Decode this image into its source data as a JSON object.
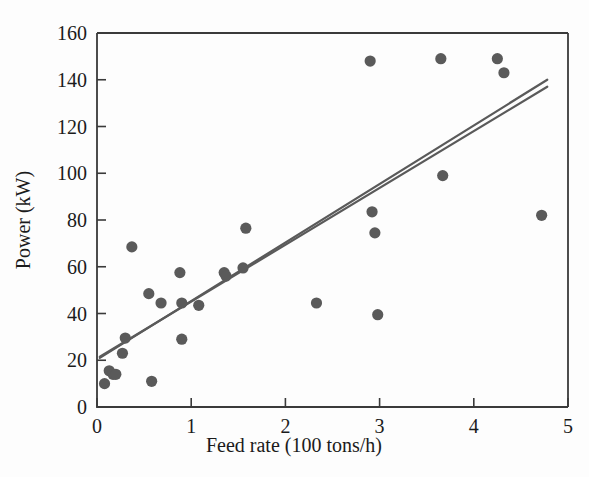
{
  "chart_data": {
    "type": "scatter",
    "title": "",
    "xlabel": "Feed rate (100 tons/h)",
    "ylabel": "Power (kW)",
    "xlim": [
      0,
      5
    ],
    "ylim": [
      0,
      160
    ],
    "xticks": [
      0,
      1,
      2,
      3,
      4,
      5
    ],
    "yticks": [
      0,
      20,
      40,
      60,
      80,
      100,
      120,
      140,
      160
    ],
    "xtick_labels": [
      "0",
      "1",
      "2",
      "3",
      "4",
      "5"
    ],
    "ytick_labels": [
      "0",
      "20",
      "40",
      "60",
      "80",
      "100",
      "120",
      "140",
      "160"
    ],
    "grid": false,
    "legend": "none",
    "marker_color": "#5a5a5a",
    "line_color": "#5a5a5a",
    "points": [
      {
        "x": 0.08,
        "y": 10.0
      },
      {
        "x": 0.13,
        "y": 15.5
      },
      {
        "x": 0.17,
        "y": 14.0
      },
      {
        "x": 0.2,
        "y": 14.0
      },
      {
        "x": 0.27,
        "y": 23.0
      },
      {
        "x": 0.3,
        "y": 29.5
      },
      {
        "x": 0.37,
        "y": 68.5
      },
      {
        "x": 0.55,
        "y": 48.5
      },
      {
        "x": 0.58,
        "y": 11.0
      },
      {
        "x": 0.68,
        "y": 44.5
      },
      {
        "x": 0.88,
        "y": 57.5
      },
      {
        "x": 0.9,
        "y": 44.5
      },
      {
        "x": 0.9,
        "y": 29.0
      },
      {
        "x": 1.08,
        "y": 43.5
      },
      {
        "x": 1.35,
        "y": 57.5
      },
      {
        "x": 1.37,
        "y": 56.0
      },
      {
        "x": 1.55,
        "y": 59.5
      },
      {
        "x": 1.58,
        "y": 76.5
      },
      {
        "x": 2.33,
        "y": 44.5
      },
      {
        "x": 2.9,
        "y": 148.0
      },
      {
        "x": 2.92,
        "y": 83.5
      },
      {
        "x": 2.95,
        "y": 74.5
      },
      {
        "x": 2.98,
        "y": 39.5
      },
      {
        "x": 3.65,
        "y": 149.0
      },
      {
        "x": 3.67,
        "y": 99.0
      },
      {
        "x": 4.25,
        "y": 149.0
      },
      {
        "x": 4.32,
        "y": 143.0
      },
      {
        "x": 4.72,
        "y": 82.0
      }
    ],
    "fit_lines": [
      {
        "name": "fit-line-1",
        "x0": 0.03,
        "y0": 21.0,
        "x1": 4.78,
        "y1": 140.0
      },
      {
        "name": "fit-line-2",
        "x0": 0.03,
        "y0": 21.5,
        "x1": 4.78,
        "y1": 137.0
      }
    ]
  }
}
